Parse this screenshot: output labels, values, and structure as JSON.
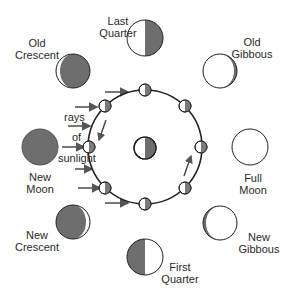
{
  "colors": {
    "shadow": "#6e6e6e",
    "lit": "#ffffff",
    "outline": "#222222",
    "arrow": "#555555",
    "text": "#2a2a2a"
  },
  "sunlight_label": [
    "rays",
    "of",
    "sunlight"
  ],
  "phases": [
    {
      "name": "last-quarter",
      "line1": "Last",
      "line2": "Quarter"
    },
    {
      "name": "old-gibbous",
      "line1": "Old",
      "line2": "Gibbous"
    },
    {
      "name": "full-moon",
      "line1": "Full",
      "line2": "Moon"
    },
    {
      "name": "new-gibbous",
      "line1": "New",
      "line2": "Gibbous"
    },
    {
      "name": "first-quarter",
      "line1": "First",
      "line2": "Quarter"
    },
    {
      "name": "new-crescent",
      "line1": "New",
      "line2": "Crescent"
    },
    {
      "name": "new-moon",
      "line1": "New",
      "line2": "Moon"
    },
    {
      "name": "old-crescent",
      "line1": "Old",
      "line2": "Crescent"
    }
  ]
}
